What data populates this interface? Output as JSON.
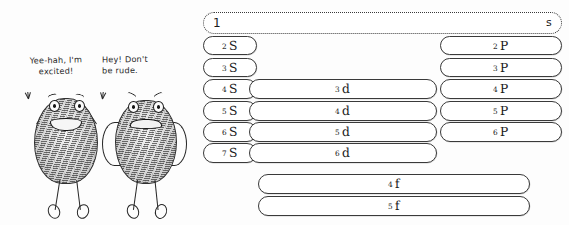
{
  "cartoon": {
    "speech_left": "Yee-hah, I'm\nexcited!",
    "speech_right": "Hey! Don't\nbe rude.",
    "figure_left_name": "excited-thumbprint-character",
    "figure_right_name": "annoyed-thumbprint-character"
  },
  "diagram": {
    "ink_color": "#3a3a3a",
    "columns": [
      {
        "key": "s",
        "label": "s"
      },
      {
        "key": "p",
        "label": "p"
      },
      {
        "key": "d",
        "label": "d"
      },
      {
        "key": "f",
        "label": "f"
      }
    ],
    "orbitals": [
      {
        "n": "1",
        "l": "s",
        "col": "s",
        "row": 1,
        "style": "dotted"
      },
      {
        "n": "2",
        "l": "S",
        "col": "s",
        "row": 2,
        "style": "solid"
      },
      {
        "n": "3",
        "l": "S",
        "col": "s",
        "row": 3,
        "style": "solid"
      },
      {
        "n": "4",
        "l": "S",
        "col": "s",
        "row": 4,
        "style": "solid"
      },
      {
        "n": "5",
        "l": "S",
        "col": "s",
        "row": 5,
        "style": "solid"
      },
      {
        "n": "6",
        "l": "S",
        "col": "s",
        "row": 6,
        "style": "solid"
      },
      {
        "n": "7",
        "l": "S",
        "col": "s",
        "row": 7,
        "style": "solid"
      },
      {
        "n": "2",
        "l": "P",
        "col": "p",
        "row": 2,
        "style": "solid"
      },
      {
        "n": "3",
        "l": "P",
        "col": "p",
        "row": 3,
        "style": "solid"
      },
      {
        "n": "4",
        "l": "P",
        "col": "p",
        "row": 4,
        "style": "solid"
      },
      {
        "n": "5",
        "l": "P",
        "col": "p",
        "row": 5,
        "style": "solid"
      },
      {
        "n": "6",
        "l": "P",
        "col": "p",
        "row": 6,
        "style": "solid"
      },
      {
        "n": "3",
        "l": "d",
        "col": "d",
        "row": 4,
        "style": "solid"
      },
      {
        "n": "4",
        "l": "d",
        "col": "d",
        "row": 5,
        "style": "solid"
      },
      {
        "n": "5",
        "l": "d",
        "col": "d",
        "row": 6,
        "style": "solid"
      },
      {
        "n": "6",
        "l": "d",
        "col": "d",
        "row": 7,
        "style": "solid"
      },
      {
        "n": "4",
        "l": "f",
        "col": "f",
        "row": 8,
        "style": "solid"
      },
      {
        "n": "5",
        "l": "f",
        "col": "f",
        "row": 9,
        "style": "solid"
      }
    ]
  },
  "labels": {
    "o_1s_n": "1",
    "o_1s_l": "s",
    "o_2s_n": "2",
    "o_2s_l": "S",
    "o_3s_n": "3",
    "o_3s_l": "S",
    "o_4s_n": "4",
    "o_4s_l": "S",
    "o_5s_n": "5",
    "o_5s_l": "S",
    "o_6s_n": "6",
    "o_6s_l": "S",
    "o_7s_n": "7",
    "o_7s_l": "S",
    "o_2p_n": "2",
    "o_2p_l": "P",
    "o_3p_n": "3",
    "o_3p_l": "P",
    "o_4p_n": "4",
    "o_4p_l": "P",
    "o_5p_n": "5",
    "o_5p_l": "P",
    "o_6p_n": "6",
    "o_6p_l": "P",
    "o_3d_n": "3",
    "o_3d_l": "d",
    "o_4d_n": "4",
    "o_4d_l": "d",
    "o_5d_n": "5",
    "o_5d_l": "d",
    "o_6d_n": "6",
    "o_6d_l": "d",
    "o_4f_n": "4",
    "o_4f_l": "f",
    "o_5f_n": "5",
    "o_5f_l": "f"
  }
}
